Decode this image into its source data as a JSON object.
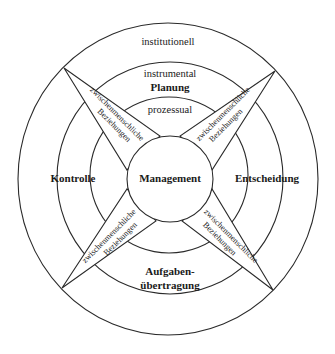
{
  "diagram": {
    "center_label": "Management",
    "rings": {
      "outer": "institutionell",
      "middle": "instrumental",
      "inner": "prozessual"
    },
    "functions": {
      "top": "Planung",
      "right": "Entscheidung",
      "bottom_line1": "Aufgaben-",
      "bottom_line2": "übertragung",
      "left": "Kontrolle"
    },
    "spikes": [
      {
        "position": "top-left",
        "line1": "zwischenmenschliche",
        "line2": "Beziehungen"
      },
      {
        "position": "top-right",
        "line1": "zwischenmenschliche",
        "line2": "Beziehungen"
      },
      {
        "position": "bottom-left",
        "line1": "zwischenmenschliche",
        "line2": "Beziehungen"
      },
      {
        "position": "bottom-right",
        "line1": "zwischenmenschliche",
        "line2": "Beziehungen"
      }
    ]
  }
}
